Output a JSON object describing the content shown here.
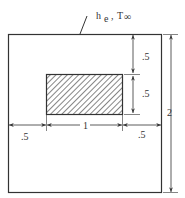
{
  "diagram": {
    "boundary_label": {
      "h": "h",
      "sub": "e",
      "sep": " , ",
      "T": "T",
      "inf": "∞"
    },
    "dimensions": {
      "top_gap": ".5",
      "inner_height": ".5",
      "left_gap": ".5",
      "inner_width": "1",
      "right_gap": ".5",
      "total_height": "2"
    },
    "colors": {
      "stroke": "#333333",
      "background": "#ffffff"
    }
  }
}
